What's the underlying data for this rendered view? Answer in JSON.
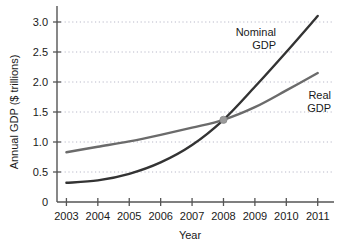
{
  "chart_data": {
    "type": "line",
    "title": "",
    "xlabel": "Year",
    "ylabel": "Annual GDP ($ trillions)",
    "xlim": [
      2002.7,
      2011.2
    ],
    "ylim": [
      0,
      3.25
    ],
    "grid": true,
    "grid_style": "dotted-horizontal",
    "legend": "inline-labels",
    "x": [
      2003,
      2004,
      2005,
      2006,
      2007,
      2008,
      2009,
      2010,
      2011
    ],
    "xticklabels": [
      "2003",
      "2004",
      "2005",
      "2006",
      "2007",
      "2008",
      "2009",
      "2010",
      "2011"
    ],
    "yticks": [
      0,
      0.5,
      1.0,
      1.5,
      2.0,
      2.5,
      3.0
    ],
    "yticklabels": [
      "0",
      "0.5",
      "1.0",
      "1.5",
      "2.0",
      "2.5",
      "3.0"
    ],
    "series": [
      {
        "name": "Nominal GDP",
        "label_line1": "Nominal",
        "label_line2": "GDP",
        "color": "#333333",
        "values": [
          0.32,
          0.36,
          0.47,
          0.66,
          0.95,
          1.37,
          1.92,
          2.5,
          3.1
        ]
      },
      {
        "name": "Real GDP",
        "label_line1": "Real",
        "label_line2": "GDP",
        "color": "#6b6b6b",
        "values": [
          0.83,
          0.92,
          1.01,
          1.12,
          1.24,
          1.37,
          1.58,
          1.86,
          2.15
        ]
      }
    ],
    "annotations": [
      {
        "name": "intersection-marker",
        "x": 2008,
        "y": 1.37,
        "color": "#9a9a9a",
        "shape": "circle"
      }
    ]
  },
  "axes": {
    "axis_color": "#555555",
    "grid_color": "#b9b9c9"
  }
}
